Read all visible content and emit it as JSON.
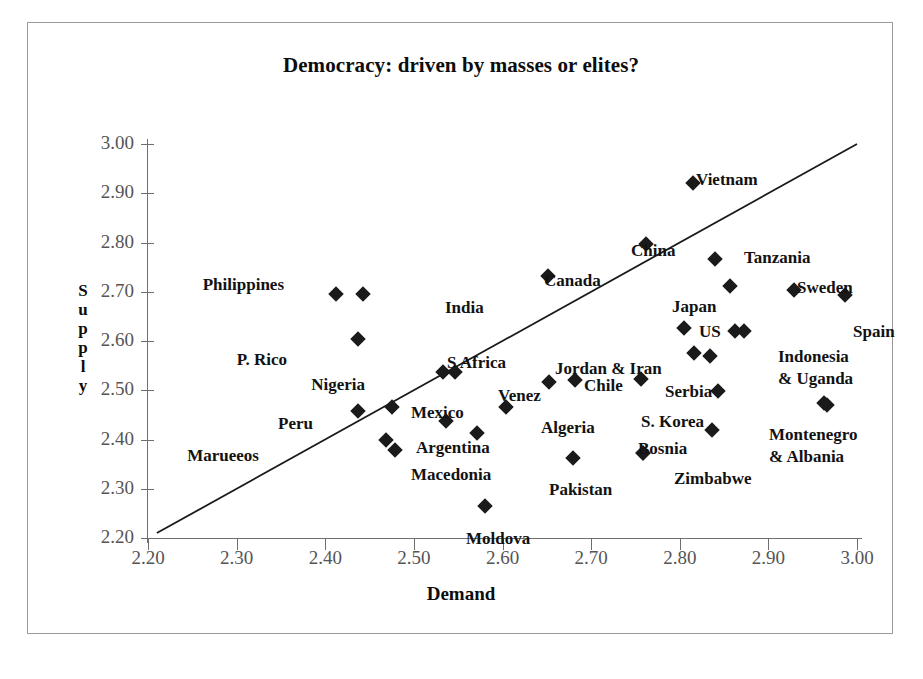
{
  "chart_data": {
    "type": "scatter",
    "title": "Democracy: driven by masses or elites?",
    "xlabel": "Demand",
    "ylabel": "Supply",
    "ylabel_letters": [
      "S",
      "u",
      "p",
      "p",
      "l",
      "y"
    ],
    "xlim": [
      2.2,
      3.0
    ],
    "ylim": [
      2.2,
      3.0
    ],
    "xticks": [
      "2.20",
      "2.30",
      "2.40",
      "2.50",
      "2.60",
      "2.70",
      "2.80",
      "2.90",
      "3.00"
    ],
    "yticks": [
      "2.20",
      "2.30",
      "2.40",
      "2.50",
      "2.60",
      "2.70",
      "2.80",
      "2.90",
      "3.00"
    ],
    "grid": false,
    "legend": "none",
    "marker": "diamond",
    "marker_color": "#1a1a1a",
    "reference_line": {
      "description": "45-degree diagonal line y = x",
      "x0": 2.21,
      "y0": 2.21,
      "x1": 3.0,
      "y1": 3.0
    },
    "points": [
      {
        "label": "Philippines",
        "x": 2.412,
        "y": 2.695,
        "lx": 256,
        "ly": 262,
        "align": "right"
      },
      {
        "label": "India",
        "x": 2.443,
        "y": 2.695,
        "lx": 417,
        "ly": 285,
        "align": "left"
      },
      {
        "label": "P. Rico",
        "x": 2.437,
        "y": 2.604,
        "lx": 259,
        "ly": 337,
        "align": "right"
      },
      {
        "label": "Nigeria",
        "x": 2.533,
        "y": 2.537,
        "lx": 337,
        "ly": 362,
        "align": "right"
      },
      {
        "label": "S Africa",
        "x": 2.546,
        "y": 2.538,
        "lx": 419,
        "ly": 340,
        "align": "left"
      },
      {
        "label": "Venez",
        "x": 2.604,
        "y": 2.466,
        "lx": 470,
        "ly": 373,
        "align": "left"
      },
      {
        "label": "Algeria",
        "x": 2.604,
        "y": 2.466,
        "lx": 513,
        "ly": 405,
        "align": "left"
      },
      {
        "label": "Peru",
        "x": 2.437,
        "y": 2.457,
        "lx": 285,
        "ly": 401,
        "align": "right"
      },
      {
        "label": "Mexico",
        "x": 2.475,
        "y": 2.465,
        "lx": 383,
        "ly": 390,
        "align": "left"
      },
      {
        "label": "Marueeos",
        "x": 2.468,
        "y": 2.398,
        "lx": 231,
        "ly": 433,
        "align": "right"
      },
      {
        "label": "Argentina",
        "x": 2.468,
        "y": 2.398,
        "lx": 388,
        "ly": 425,
        "align": "left"
      },
      {
        "label": "Macedonia",
        "x": 2.479,
        "y": 2.378,
        "lx": 383,
        "ly": 452,
        "align": "left"
      },
      {
        "label": "Moldova",
        "x": 2.58,
        "y": 2.265,
        "lx": 438,
        "ly": 516,
        "align": "left"
      },
      {
        "label": "Pakistan",
        "x": 2.679,
        "y": 2.363,
        "lx": 521,
        "ly": 467,
        "align": "left"
      },
      {
        "label": "Canada",
        "x": 2.651,
        "y": 2.732,
        "lx": 516,
        "ly": 258,
        "align": "left"
      },
      {
        "label": "China",
        "x": 2.762,
        "y": 2.797,
        "lx": 603,
        "ly": 228,
        "align": "left"
      },
      {
        "label": "Vietnam",
        "x": 2.815,
        "y": 2.92,
        "lx": 668,
        "ly": 157,
        "align": "left"
      },
      {
        "label": "Tanzania",
        "x": 2.84,
        "y": 2.767,
        "lx": 716,
        "ly": 235,
        "align": "left"
      },
      {
        "label": "Japan",
        "x": 2.836,
        "y": 2.712,
        "lx": 644,
        "ly": 284,
        "align": "left"
      },
      {
        "label": "Sweden",
        "x": 2.929,
        "y": 2.704,
        "lx": 769,
        "ly": 265,
        "align": "left"
      },
      {
        "label": "Spain",
        "x": 2.986,
        "y": 2.694,
        "lx": 825,
        "ly": 309,
        "align": "left"
      },
      {
        "label": "US",
        "x": 2.805,
        "y": 2.627,
        "lx": 671,
        "ly": 309,
        "align": "left"
      },
      {
        "label": "Indonesia",
        "x": 2.862,
        "y": 2.621,
        "lx": 750,
        "ly": 334,
        "align": "left"
      },
      {
        "label": "& Uganda",
        "x": 2.869,
        "y": 2.621,
        "lx": 750,
        "ly": 356,
        "align": "left"
      },
      {
        "label": "Jordan & Iran",
        "x": 2.816,
        "y": 2.575,
        "lx": 527,
        "ly": 346,
        "align": "left"
      },
      {
        "label": "Chile",
        "x": 2.834,
        "y": 2.57,
        "lx": 556,
        "ly": 363,
        "align": "left"
      },
      {
        "label": "Serbia",
        "x": 2.756,
        "y": 2.523,
        "lx": 637,
        "ly": 369,
        "align": "left"
      },
      {
        "label": "S. Korea",
        "x": 2.843,
        "y": 2.498,
        "lx": 613,
        "ly": 399,
        "align": "left"
      },
      {
        "label": "Bosnia",
        "x": 2.759,
        "y": 2.372,
        "lx": 610,
        "ly": 426,
        "align": "left"
      },
      {
        "label": "Zimbabwe",
        "x": 2.836,
        "y": 2.42,
        "lx": 646,
        "ly": 456,
        "align": "left"
      },
      {
        "label": "Montenegro",
        "x": 2.963,
        "y": 2.474,
        "lx": 741,
        "ly": 412,
        "align": "left"
      },
      {
        "label": "& Albania",
        "x": 2.966,
        "y": 2.47,
        "lx": 741,
        "ly": 434,
        "align": "left"
      }
    ],
    "markers": [
      {
        "name": "philippines-marker",
        "x": 2.412,
        "y": 2.695
      },
      {
        "name": "india-marker",
        "x": 2.443,
        "y": 2.695
      },
      {
        "name": "p-rico-marker",
        "x": 2.437,
        "y": 2.604
      },
      {
        "name": "nigeria-marker",
        "x": 2.533,
        "y": 2.537
      },
      {
        "name": "s-africa-marker",
        "x": 2.546,
        "y": 2.538
      },
      {
        "name": "peru-marker",
        "x": 2.437,
        "y": 2.457
      },
      {
        "name": "mexico-marker",
        "x": 2.475,
        "y": 2.465
      },
      {
        "name": "venez-marker",
        "x": 2.604,
        "y": 2.466
      },
      {
        "name": "argentina-marker",
        "x": 2.468,
        "y": 2.398
      },
      {
        "name": "macedonia-marker",
        "x": 2.479,
        "y": 2.378
      },
      {
        "name": "unnamed-marker-1",
        "x": 2.536,
        "y": 2.438
      },
      {
        "name": "algeria-marker",
        "x": 2.571,
        "y": 2.414
      },
      {
        "name": "moldova-marker",
        "x": 2.58,
        "y": 2.265
      },
      {
        "name": "pakistan-marker",
        "x": 2.679,
        "y": 2.363
      },
      {
        "name": "canada-marker",
        "x": 2.651,
        "y": 2.732
      },
      {
        "name": "china-marker",
        "x": 2.762,
        "y": 2.797
      },
      {
        "name": "vietnam-marker",
        "x": 2.815,
        "y": 2.92
      },
      {
        "name": "tanzania-marker",
        "x": 2.84,
        "y": 2.767
      },
      {
        "name": "japan-marker",
        "x": 2.857,
        "y": 2.712
      },
      {
        "name": "sweden-marker",
        "x": 2.929,
        "y": 2.704
      },
      {
        "name": "spain-marker",
        "x": 2.986,
        "y": 2.694
      },
      {
        "name": "us-marker",
        "x": 2.805,
        "y": 2.627
      },
      {
        "name": "indonesia-marker",
        "x": 2.862,
        "y": 2.621
      },
      {
        "name": "uganda-marker",
        "x": 2.873,
        "y": 2.621
      },
      {
        "name": "jordan-marker",
        "x": 2.816,
        "y": 2.575
      },
      {
        "name": "iran-marker",
        "x": 2.834,
        "y": 2.57
      },
      {
        "name": "chile-marker",
        "x": 2.682,
        "y": 2.52
      },
      {
        "name": "serbia-marker",
        "x": 2.756,
        "y": 2.523
      },
      {
        "name": "s-korea-marker",
        "x": 2.843,
        "y": 2.498
      },
      {
        "name": "bosnia-marker",
        "x": 2.836,
        "y": 2.42
      },
      {
        "name": "zimbabwe-marker",
        "x": 2.759,
        "y": 2.372
      },
      {
        "name": "montenegro-marker",
        "x": 2.963,
        "y": 2.474
      },
      {
        "name": "albania-marker",
        "x": 2.966,
        "y": 2.47
      },
      {
        "name": "unnamed-marker-2",
        "x": 2.653,
        "y": 2.516
      },
      {
        "name": "unnamed-marker-3",
        "x": 2.759,
        "y": 2.372
      }
    ]
  }
}
